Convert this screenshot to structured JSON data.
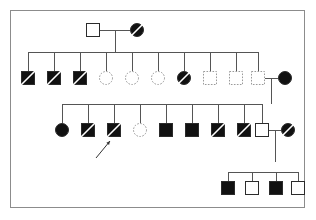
{
  "canvas": {
    "width": 316,
    "height": 220,
    "background": "#ffffff"
  },
  "frame": {
    "x": 10,
    "y": 10,
    "width": 295,
    "height": 198,
    "stroke": "#8c8c8c",
    "stroke_width": 1
  },
  "style": {
    "symbol_size": 13,
    "line_color": "#555555",
    "line_width": 1,
    "dotted_color": "#9a9a9a",
    "solid_stroke": "#2b2b2b",
    "fill_affected": "#111111",
    "fill_unaffected": "#ffffff",
    "slash_color": "#ffffff",
    "slash_color_open": "#555555",
    "arrow_color": "#333333"
  },
  "legend_semantics": {
    "square": "male",
    "circle": "female",
    "filled": "affected",
    "open": "unaffected",
    "dotted_outline": "unaffected-no-data",
    "slash": "deceased",
    "arrow": "proband"
  },
  "generations": [
    {
      "id": "generation-1",
      "label": "I",
      "y": 30,
      "members": [
        {
          "id": "I-1",
          "shape": "square",
          "fill": "open",
          "outline": "solid",
          "slashed": false,
          "x": 93,
          "sex": "male",
          "affected": false,
          "deceased": false
        },
        {
          "id": "I-2",
          "shape": "circle",
          "fill": "filled",
          "outline": "solid",
          "slashed": true,
          "x": 137,
          "sex": "female",
          "affected": true,
          "deceased": true
        }
      ]
    },
    {
      "id": "generation-2",
      "label": "II",
      "y": 78,
      "members": [
        {
          "id": "II-1",
          "shape": "square",
          "fill": "filled",
          "outline": "solid",
          "slashed": true,
          "x": 28,
          "sex": "male",
          "affected": true,
          "deceased": true
        },
        {
          "id": "II-2",
          "shape": "square",
          "fill": "filled",
          "outline": "solid",
          "slashed": true,
          "x": 54,
          "sex": "male",
          "affected": true,
          "deceased": true
        },
        {
          "id": "II-3",
          "shape": "square",
          "fill": "filled",
          "outline": "solid",
          "slashed": true,
          "x": 80,
          "sex": "male",
          "affected": true,
          "deceased": true
        },
        {
          "id": "II-4",
          "shape": "circle",
          "fill": "open",
          "outline": "dotted",
          "slashed": false,
          "x": 106,
          "sex": "female",
          "affected": false,
          "deceased": false
        },
        {
          "id": "II-5",
          "shape": "circle",
          "fill": "open",
          "outline": "dotted",
          "slashed": false,
          "x": 132,
          "sex": "female",
          "affected": false,
          "deceased": false
        },
        {
          "id": "II-6",
          "shape": "circle",
          "fill": "open",
          "outline": "dotted",
          "slashed": false,
          "x": 158,
          "sex": "female",
          "affected": false,
          "deceased": false
        },
        {
          "id": "II-7",
          "shape": "circle",
          "fill": "filled",
          "outline": "solid",
          "slashed": true,
          "x": 184,
          "sex": "female",
          "affected": true,
          "deceased": true
        },
        {
          "id": "II-8",
          "shape": "square",
          "fill": "open",
          "outline": "dotted",
          "slashed": false,
          "x": 210,
          "sex": "male",
          "affected": false,
          "deceased": false
        },
        {
          "id": "II-9",
          "shape": "square",
          "fill": "open",
          "outline": "dotted",
          "slashed": false,
          "x": 236,
          "sex": "male",
          "affected": false,
          "deceased": false
        },
        {
          "id": "II-10",
          "shape": "square",
          "fill": "open",
          "outline": "dotted",
          "slashed": false,
          "x": 258,
          "sex": "male",
          "affected": false,
          "deceased": false
        },
        {
          "id": "II-11",
          "shape": "circle",
          "fill": "filled",
          "outline": "solid",
          "slashed": false,
          "x": 285,
          "sex": "female",
          "affected": true,
          "deceased": false
        }
      ]
    },
    {
      "id": "generation-3",
      "label": "III",
      "y": 130,
      "members": [
        {
          "id": "III-1",
          "shape": "circle",
          "fill": "filled",
          "outline": "solid",
          "slashed": false,
          "x": 62,
          "sex": "female",
          "affected": true,
          "deceased": false
        },
        {
          "id": "III-2",
          "shape": "square",
          "fill": "filled",
          "outline": "solid",
          "slashed": true,
          "x": 88,
          "sex": "male",
          "affected": true,
          "deceased": true
        },
        {
          "id": "III-3",
          "shape": "square",
          "fill": "filled",
          "outline": "solid",
          "slashed": true,
          "x": 114,
          "sex": "male",
          "affected": true,
          "deceased": true,
          "proband": true
        },
        {
          "id": "III-4",
          "shape": "circle",
          "fill": "open",
          "outline": "dotted",
          "slashed": false,
          "x": 140,
          "sex": "female",
          "affected": false,
          "deceased": false
        },
        {
          "id": "III-5",
          "shape": "square",
          "fill": "filled",
          "outline": "solid",
          "slashed": false,
          "x": 166,
          "sex": "male",
          "affected": true,
          "deceased": false
        },
        {
          "id": "III-6",
          "shape": "square",
          "fill": "filled",
          "outline": "solid",
          "slashed": false,
          "x": 192,
          "sex": "male",
          "affected": true,
          "deceased": false
        },
        {
          "id": "III-7",
          "shape": "square",
          "fill": "filled",
          "outline": "solid",
          "slashed": true,
          "x": 218,
          "sex": "male",
          "affected": true,
          "deceased": true
        },
        {
          "id": "III-8",
          "shape": "square",
          "fill": "filled",
          "outline": "solid",
          "slashed": true,
          "x": 244,
          "sex": "male",
          "affected": true,
          "deceased": true
        },
        {
          "id": "III-9",
          "shape": "square",
          "fill": "open",
          "outline": "solid",
          "slashed": false,
          "x": 262,
          "sex": "male",
          "affected": false,
          "deceased": false
        },
        {
          "id": "III-10",
          "shape": "circle",
          "fill": "filled",
          "outline": "solid",
          "slashed": true,
          "x": 288,
          "sex": "female",
          "affected": true,
          "deceased": true
        }
      ]
    },
    {
      "id": "generation-4",
      "label": "IV",
      "y": 188,
      "members": [
        {
          "id": "IV-1",
          "shape": "square",
          "fill": "filled",
          "outline": "solid",
          "slashed": false,
          "x": 228,
          "sex": "male",
          "affected": true,
          "deceased": false
        },
        {
          "id": "IV-2",
          "shape": "square",
          "fill": "open",
          "outline": "solid",
          "slashed": false,
          "x": 252,
          "sex": "male",
          "affected": false,
          "deceased": false
        },
        {
          "id": "IV-3",
          "shape": "square",
          "fill": "filled",
          "outline": "solid",
          "slashed": false,
          "x": 276,
          "sex": "male",
          "affected": true,
          "deceased": false
        },
        {
          "id": "IV-4",
          "shape": "square",
          "fill": "open",
          "outline": "solid",
          "slashed": false,
          "x": 298,
          "sex": "male",
          "affected": false,
          "deceased": false
        }
      ]
    }
  ],
  "matings": [
    {
      "id": "mating-1",
      "partners": [
        "I-1",
        "I-2"
      ],
      "line_y": 30,
      "x1": 100,
      "x2": 130,
      "descent_x": 115,
      "descent_y2": 52
    },
    {
      "id": "mating-2",
      "partners": [
        "II-10",
        "II-11"
      ],
      "line_y": 78,
      "x1": 265,
      "x2": 278,
      "descent_x": 271,
      "descent_y2": 104
    },
    {
      "id": "mating-3",
      "partners": [
        "III-9",
        "III-10"
      ],
      "line_y": 130,
      "x1": 269,
      "x2": 281,
      "descent_x": 275,
      "descent_y2": 162
    }
  ],
  "sibships": [
    {
      "id": "sibship-1",
      "parents": "mating-1",
      "line_y": 52,
      "x_start": 28,
      "x_end": 258,
      "drop_to": 71,
      "child_x": [
        28,
        54,
        80,
        106,
        132,
        158,
        184,
        210,
        236,
        258
      ]
    },
    {
      "id": "sibship-2",
      "parents": "mating-2",
      "line_y": 104,
      "x_start": 62,
      "x_end": 262,
      "drop_to": 123,
      "child_x": [
        62,
        88,
        114,
        140,
        166,
        192,
        218,
        244,
        262
      ]
    },
    {
      "id": "sibship-3",
      "parents": "mating-3",
      "line_y": 172,
      "x_start": 228,
      "x_end": 298,
      "drop_to": 181,
      "child_x": [
        228,
        252,
        276,
        298
      ]
    }
  ],
  "proband_arrow": {
    "id": "proband-arrow",
    "points_to": "III-3",
    "x1": 96,
    "y1": 158,
    "x2": 110,
    "y2": 141,
    "head_size": 4
  }
}
